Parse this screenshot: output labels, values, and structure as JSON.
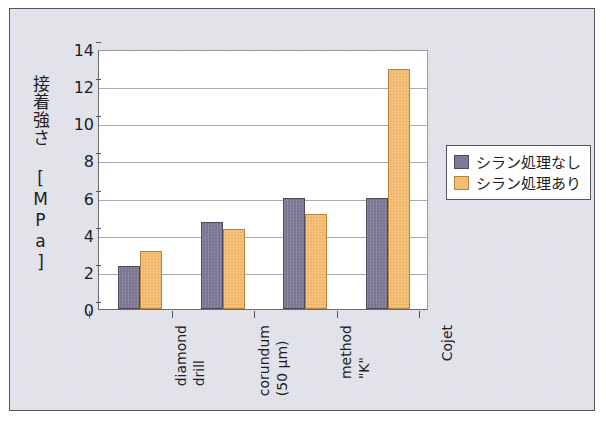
{
  "chart_data": {
    "type": "bar",
    "title": "",
    "subtitle": "",
    "xlabel": "",
    "ylabel": "接着強さ [MPa]",
    "categories": [
      [
        "diamond",
        "drill"
      ],
      [
        "corundum",
        "(50 μm)"
      ],
      [
        "method",
        "\"K\""
      ],
      [
        "Cojet"
      ]
    ],
    "category_labels": [
      "diamond drill",
      "corundum (50 μm)",
      "method \"K\"",
      "Cojet"
    ],
    "series": [
      {
        "name": "シラン処理なし",
        "color": "#7e7893",
        "values": [
          2.3,
          4.7,
          6.0,
          6.0
        ]
      },
      {
        "name": "シラン処理あり",
        "color": "#f5bd70",
        "values": [
          3.1,
          4.3,
          5.1,
          12.9
        ]
      }
    ],
    "ylim": [
      0,
      14
    ],
    "ytick_step": 2,
    "yticks": [
      "14",
      "12",
      "10",
      "8",
      "6",
      "4",
      "2",
      "0"
    ],
    "ytick_values": [
      14,
      12,
      10,
      8,
      6,
      4,
      2,
      0
    ],
    "grid": true,
    "grid_axis": "y",
    "legend_position": "right"
  },
  "legend": {
    "entries": [
      {
        "label": "シラン処理なし"
      },
      {
        "label": "シラン処理あり"
      }
    ]
  },
  "colors": {
    "series_no_silane": "#7e7893",
    "series_with_silane": "#f5bd70",
    "background": "#e2e2ea",
    "plot_background": "#ffffff",
    "frame_border": "#55555f",
    "gridline": "#a9a9b1",
    "text": "#1d1d22"
  }
}
